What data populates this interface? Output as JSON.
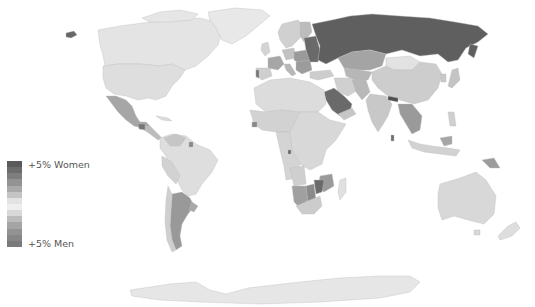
{
  "legend": {
    "top_label": "+5% Women",
    "bottom_label": "+5% Men",
    "scale": [
      "#5a5a5a",
      "#6c6c6c",
      "#7e7e7e",
      "#939393",
      "#aaaaaa",
      "#c4c4c4",
      "#e3e3e3",
      "#eeeeee",
      "#d8d8d8",
      "#bcbcbc",
      "#a5a5a5",
      "#939393",
      "#868686",
      "#7a7a7a"
    ]
  },
  "colors": {
    "background": "#ffffff",
    "neutral_land": "#dcdcdc",
    "light_land": "#e6e6e6",
    "antarctica": "#e8e8e8",
    "strong_women": "#5f5f5f",
    "medium_women": "#8a8a8a",
    "slight_women": "#b4b4b4",
    "slight_men": "#c8c8c8",
    "medium_men": "#9a9a9a",
    "strong_men": "#7a7a7a"
  }
}
